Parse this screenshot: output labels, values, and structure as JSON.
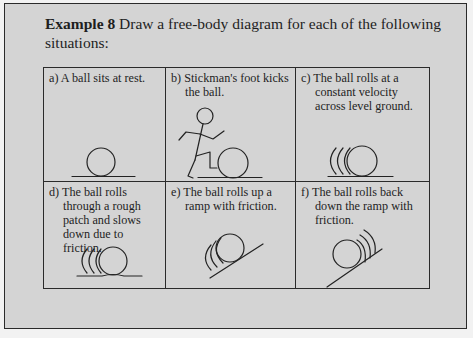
{
  "example": {
    "label": "Example 8",
    "prompt": "Draw a free-body diagram for each of the following situations:"
  },
  "situations": [
    {
      "id": "a",
      "text": "a) A ball sits at rest.",
      "drawing": "ball-at-rest"
    },
    {
      "id": "b",
      "text": "b) Stickman's foot kicks the ball.",
      "drawing": "stickman-kicking-ball"
    },
    {
      "id": "c",
      "text": "c) The ball rolls at a constant velocity across level ground.",
      "drawing": "ball-rolling-level"
    },
    {
      "id": "d",
      "text": "d) The ball rolls through a rough patch and slows down due to friction.",
      "drawing": "ball-rolling-rough-patch"
    },
    {
      "id": "e",
      "text": "e) The ball rolls up a ramp with friction.",
      "drawing": "ball-rolling-up-ramp"
    },
    {
      "id": "f",
      "text": "f) The ball rolls back down the ramp with friction.",
      "drawing": "ball-rolling-down-ramp"
    }
  ],
  "colors": {
    "panel_background": "#d4d4d4",
    "page_background": "#f2f2f2",
    "line": "#222222"
  }
}
